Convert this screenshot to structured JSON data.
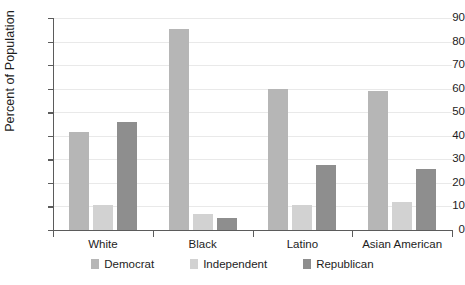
{
  "chart_data": {
    "type": "bar",
    "title": "",
    "xlabel": "",
    "ylabel": "Percent of Population",
    "ylim": [
      0,
      90
    ],
    "ytick_step": 10,
    "yticks": [
      0,
      10,
      20,
      30,
      40,
      50,
      60,
      70,
      80,
      90
    ],
    "grid": true,
    "legend_position": "bottom",
    "categories": [
      "White",
      "Black",
      "Latino",
      "Asian American"
    ],
    "series": [
      {
        "name": "Democrat",
        "color": "#b6b6b6",
        "values": [
          41.5,
          85.5,
          60.0,
          59.0
        ]
      },
      {
        "name": "Independent",
        "color": "#d2d2d2",
        "values": [
          10.5,
          7.0,
          10.5,
          12.0
        ]
      },
      {
        "name": "Republican",
        "color": "#8e8e8e",
        "values": [
          46.0,
          5.0,
          27.5,
          26.0
        ]
      }
    ]
  }
}
